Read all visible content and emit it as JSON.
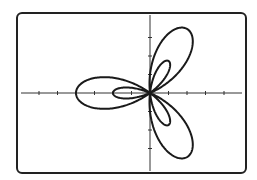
{
  "chart_data": {
    "type": "line",
    "subtype": "polar",
    "title": "",
    "equation": "r = 1 - 3cos(3θ)",
    "theta_range": [
      0,
      6.2832
    ],
    "xlim": [
      -6,
      5
    ],
    "ylim": [
      -4.3,
      4.3
    ],
    "x_ticks": [
      -6,
      -5,
      -4,
      -3,
      -2,
      -1,
      1,
      2,
      3,
      4
    ],
    "y_ticks": [
      -3,
      -2,
      -1,
      1,
      2,
      3
    ],
    "grid": false,
    "legend": null,
    "features": {
      "outer_petals": 3,
      "outer_petal_length": 4,
      "outer_petal_directions_deg": [
        60,
        180,
        300
      ],
      "inner_petals": 3,
      "inner_petal_length": 2,
      "inner_petal_directions_deg": [
        0,
        120,
        240
      ]
    }
  },
  "colors": {
    "curve": "#1a1a1a",
    "axes": "#333333",
    "frame": "#222222",
    "background": "#ffffff"
  },
  "layout": {
    "origin_px": [
      150,
      93
    ],
    "unit_px": 18.5,
    "frame": {
      "x": 17,
      "y": 13,
      "w": 229,
      "h": 160,
      "r": 5
    }
  }
}
